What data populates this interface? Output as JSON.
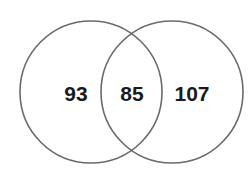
{
  "diagram": {
    "type": "venn",
    "sets": 2,
    "regions": {
      "left_only": "93",
      "intersection": "85",
      "right_only": "107"
    },
    "stroke_color": "#6a6a6a",
    "text_color": "#1a1a1a",
    "background": "#ffffff"
  }
}
